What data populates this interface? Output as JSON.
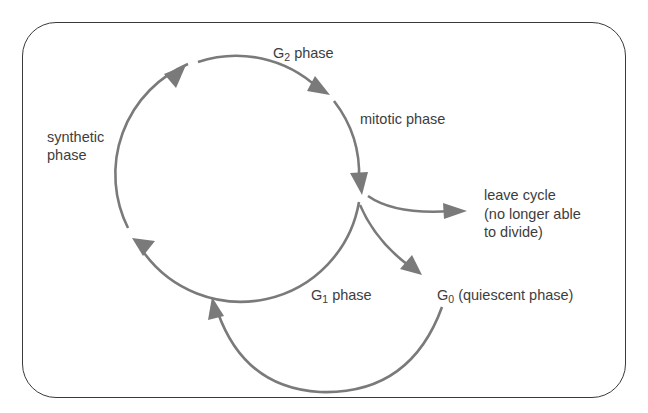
{
  "diagram": {
    "colors": {
      "arrow": "#7a7a7a",
      "text": "#3d3d3d",
      "frame": "#3a3a3a",
      "background": "#ffffff"
    },
    "labels": {
      "g2_prefix": "G",
      "g2_sub": "2",
      "g2_suffix": " phase",
      "mitotic": "mitotic phase",
      "synthetic": "synthetic\nphase",
      "leave_cycle": "leave cycle\n(no longer able\nto divide)",
      "g1_prefix": "G",
      "g1_sub": "1",
      "g1_suffix": " phase",
      "g0_prefix": "G",
      "g0_sub": "0",
      "g0_suffix": " (quiescent phase)"
    },
    "nodes": [
      {
        "id": "g1",
        "label": "G1 phase"
      },
      {
        "id": "s",
        "label": "synthetic phase"
      },
      {
        "id": "g2",
        "label": "G2 phase"
      },
      {
        "id": "m",
        "label": "mitotic phase"
      },
      {
        "id": "g0",
        "label": "G0 (quiescent phase)"
      },
      {
        "id": "leave",
        "label": "leave cycle (no longer able to divide)"
      }
    ],
    "edges": [
      {
        "from": "g1",
        "to": "s"
      },
      {
        "from": "s",
        "to": "g2"
      },
      {
        "from": "g2",
        "to": "m"
      },
      {
        "from": "m",
        "to": "g1"
      },
      {
        "from": "m",
        "to": "leave"
      },
      {
        "from": "m",
        "to": "g0"
      },
      {
        "from": "g0",
        "to": "g1"
      }
    ]
  }
}
